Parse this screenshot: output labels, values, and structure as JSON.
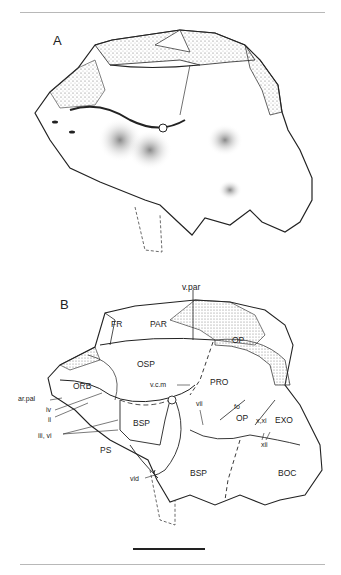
{
  "figure": {
    "panels": [
      {
        "letter": "A",
        "description": "Stippled lateral view of braincase"
      },
      {
        "letter": "B",
        "description": "Labeled line drawing of braincase"
      }
    ],
    "labels": {
      "v_par": "v.par",
      "fr": "FR",
      "par": "PAR",
      "op_top": "OP",
      "osp": "OSP",
      "orb": "ORB",
      "ar_pal": "ar.pal",
      "iv": "iv",
      "ii": "ii",
      "iii_vi": "iii, vi",
      "ps": "PS",
      "vcm": "v.c.m",
      "pro": "PRO",
      "bsp_upper": "BSP",
      "vii": "vii",
      "fo": "fo",
      "op_mid": "OP",
      "x_xi": "x,xi",
      "exo": "EXO",
      "xii": "xii",
      "bsp_lower": "BSP",
      "boc": "BOC",
      "vid": "vid"
    },
    "scale_bar": {
      "visible": true
    }
  }
}
